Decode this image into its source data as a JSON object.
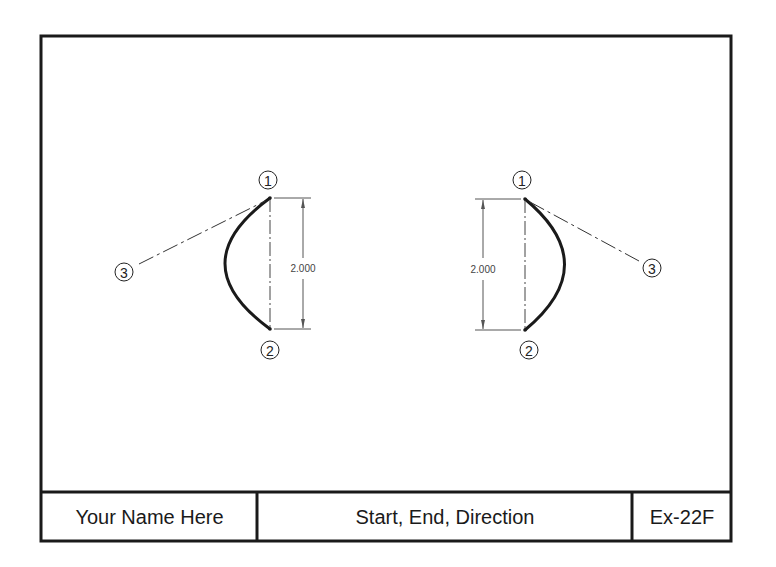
{
  "title_block": {
    "name": "Your Name Here",
    "title": "Start, End, Direction",
    "exercise": "Ex-22F"
  },
  "colors": {
    "line": "#1a1a1a",
    "thin_line": "#555555",
    "background": "#ffffff"
  },
  "left_view": {
    "point_labels": [
      "1",
      "2",
      "3"
    ],
    "dimension": "2.000",
    "arc_direction": "left"
  },
  "right_view": {
    "point_labels": [
      "1",
      "2",
      "3"
    ],
    "dimension": "2.000",
    "arc_direction": "right"
  }
}
